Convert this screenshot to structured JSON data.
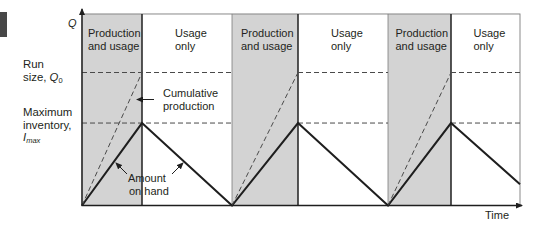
{
  "figure": {
    "y_axis_label": "Q",
    "x_axis_label": "Time",
    "labels": {
      "run_size": {
        "line1": "Run",
        "line2": "size, ",
        "symbol": "Q",
        "subscript": "0"
      },
      "max_inventory": {
        "line1": "Maximum",
        "line2": "inventory,",
        "symbol": "I",
        "subscript": "max"
      }
    },
    "annotations": {
      "cumulative_production": {
        "line1": "Cumulative",
        "line2": "production"
      },
      "amount_on_hand": {
        "line1": "Amount",
        "line2": "on hand"
      }
    }
  },
  "colors": {
    "production_fill": "#d3d3d3",
    "usage_fill": "#ffffff",
    "line": "#1e1e1e",
    "dashed": "#4a4a4a",
    "frame": "#7c7c7c",
    "divider": "#2c2c2c",
    "text": "#231f20",
    "edge_tab": "#474747"
  },
  "chart_data": {
    "type": "line",
    "title": "",
    "xlabel": "Time",
    "ylabel": "Q",
    "xlim": [
      0,
      7.3
    ],
    "ylim": [
      0,
      1.44
    ],
    "grid": false,
    "legend": null,
    "phases": [
      {
        "type": "production",
        "label_line1": "Production",
        "label_line2": "and usage",
        "x": [
          0,
          1
        ]
      },
      {
        "type": "usage",
        "label_line1": "Usage",
        "label_line2": "only",
        "x": [
          1,
          2.5
        ]
      },
      {
        "type": "production",
        "label_line1": "Production",
        "label_line2": "and usage",
        "x": [
          2.5,
          3.6
        ]
      },
      {
        "type": "usage",
        "label_line1": "Usage",
        "label_line2": "only",
        "x": [
          3.6,
          5.1
        ]
      },
      {
        "type": "production",
        "label_line1": "Production",
        "label_line2": "and usage",
        "x": [
          5.1,
          6.15
        ]
      },
      {
        "type": "usage",
        "label_line1": "Usage",
        "label_line2": "only",
        "x": [
          6.15,
          7.3
        ]
      }
    ],
    "reference_levels": [
      {
        "name": "Run size, Q0",
        "y": 1.0,
        "style": "dashed",
        "segments": [
          [
            0,
            2.5
          ],
          [
            3.6,
            5.1
          ],
          [
            6.15,
            7.3
          ]
        ]
      },
      {
        "name": "Maximum inventory, Imax",
        "y": 0.62,
        "style": "dashed",
        "segments": [
          [
            0,
            2.5
          ],
          [
            3.6,
            5.1
          ],
          [
            6.15,
            7.3
          ]
        ]
      }
    ],
    "series": [
      {
        "name": "Amount on hand",
        "style": "solid",
        "x": [
          0,
          1,
          2.5,
          3.6,
          5.1,
          6.15,
          7.3
        ],
        "y": [
          0,
          0.62,
          0,
          0.62,
          0,
          0.62,
          0.16
        ]
      },
      {
        "name": "Cumulative production",
        "style": "dashed",
        "segments": [
          {
            "x": [
              0,
              1
            ],
            "y": [
              0,
              1
            ]
          },
          {
            "x": [
              2.5,
              3.6
            ],
            "y": [
              0,
              1
            ]
          },
          {
            "x": [
              5.1,
              6.15
            ],
            "y": [
              0,
              1
            ]
          }
        ]
      }
    ],
    "annotations": [
      "Cumulative production",
      "Amount on hand"
    ]
  }
}
